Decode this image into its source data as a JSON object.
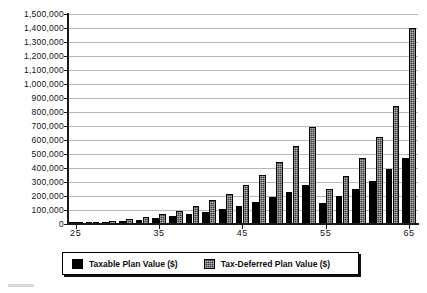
{
  "chart_data": {
    "type": "bar",
    "title": "",
    "subtitle": "",
    "xlabel": "",
    "ylabel": "",
    "ylim": [
      0,
      1500000
    ],
    "ytick_step": 100000,
    "grid": true,
    "legend_position": "bottom",
    "categories": [
      25,
      27,
      29,
      31,
      33,
      35,
      37,
      39,
      41,
      43,
      45,
      47,
      49,
      51,
      53,
      55,
      57,
      59,
      61,
      63,
      65
    ],
    "ytick_labels": [
      "1,500,000",
      "1,400,000",
      "1,300,000",
      "1,200,000",
      "1,100,000",
      "1,000,000",
      "900,000",
      "800,000",
      "700,000",
      "600,000",
      "500,000",
      "400,000",
      "300,000",
      "200,000",
      "100,000",
      "0"
    ],
    "ytick_values": [
      1500000,
      1400000,
      1300000,
      1200000,
      1100000,
      1000000,
      900000,
      800000,
      700000,
      600000,
      500000,
      400000,
      300000,
      200000,
      100000,
      0
    ],
    "xtick_labels": [
      "25",
      "30",
      "35",
      "40",
      "45",
      "50",
      "55",
      "60",
      "65"
    ],
    "xtick_values": [
      25,
      30,
      35,
      40,
      45,
      50,
      55,
      60,
      65
    ],
    "series": [
      {
        "name": "Taxable Plan Value ($)",
        "color": "#000000",
        "values": [
          3000,
          8000,
          14000,
          22000,
          31000,
          42000,
          55000,
          70000,
          88000,
          108000,
          132000,
          160000,
          193000,
          232000,
          277000,
          150000,
          200000,
          250000,
          310000,
          390000,
          475000
        ]
      },
      {
        "name": "Tax-Deferred Plan Value ($)",
        "color": "#3b3b3b",
        "values": [
          4000,
          11000,
          20000,
          33000,
          49000,
          70000,
          96000,
          128000,
          168000,
          217000,
          278000,
          352000,
          443000,
          554000,
          690000,
          250000,
          340000,
          470000,
          620000,
          840000,
          1400000
        ]
      }
    ]
  },
  "legend": {
    "entries": [
      {
        "label": "Taxable Plan Value ($)",
        "swatch": "black-solid"
      },
      {
        "label": "Tax-Deferred Plan Value ($)",
        "swatch": "gray-dotted"
      }
    ]
  }
}
